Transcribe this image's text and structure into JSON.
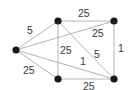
{
  "graph": {
    "nodes": [
      {
        "id": "left",
        "x": 16,
        "y": 50
      },
      {
        "id": "top-mid",
        "x": 58,
        "y": 21
      },
      {
        "id": "top-right",
        "x": 114,
        "y": 21
      },
      {
        "id": "bottom-mid",
        "x": 58,
        "y": 79
      },
      {
        "id": "bottom-right",
        "x": 114,
        "y": 79
      }
    ],
    "edges": [
      {
        "from": "left",
        "to": "top-mid",
        "weight": "5",
        "lx": 27,
        "ly": 34
      },
      {
        "from": "left",
        "to": "top-right",
        "weight": "25",
        "lx": 92,
        "ly": 37
      },
      {
        "from": "left",
        "to": "bottom-mid",
        "weight": "25",
        "lx": 23,
        "ly": 74
      },
      {
        "from": "left",
        "to": "bottom-right",
        "weight": "1",
        "lx": 80,
        "ly": 65
      },
      {
        "from": "top-mid",
        "to": "top-right",
        "weight": "25",
        "lx": 78,
        "ly": 17
      },
      {
        "from": "top-mid",
        "to": "bottom-mid",
        "weight": "25",
        "lx": 60,
        "ly": 54
      },
      {
        "from": "top-mid",
        "to": "bottom-right",
        "weight": "5",
        "lx": 94,
        "ly": 58
      },
      {
        "from": "top-right",
        "to": "bottom-right",
        "weight": "1",
        "lx": 118,
        "ly": 52
      },
      {
        "from": "bottom-mid",
        "to": "bottom-right",
        "weight": "25",
        "lx": 83,
        "ly": 90
      }
    ]
  },
  "colors": {
    "edge": "#b4b4b4",
    "node": "#1a1a1a",
    "label": "#3a3a3a"
  }
}
